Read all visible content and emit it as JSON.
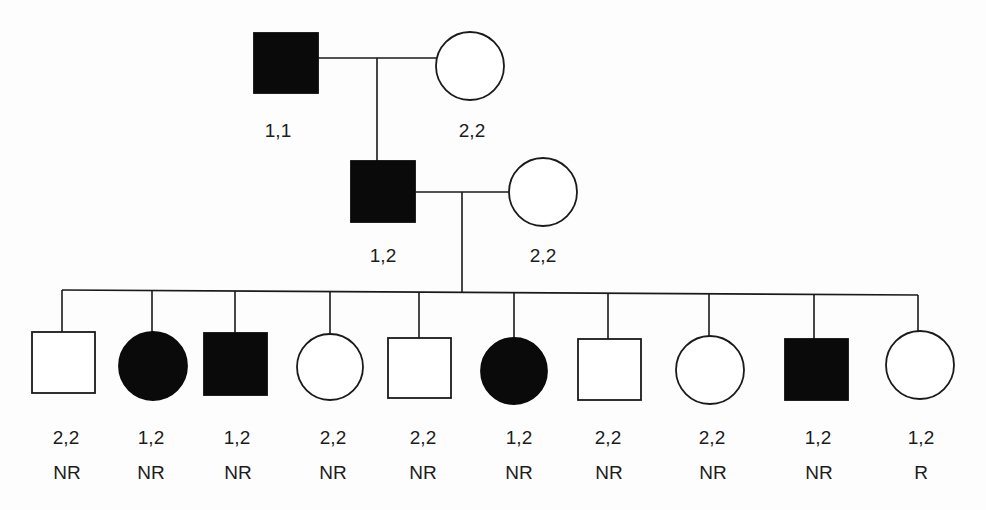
{
  "diagram": {
    "type": "pedigree",
    "legend_semantics": {
      "square": "male",
      "circle": "female",
      "filled": "affected",
      "open": "unaffected"
    },
    "colors": {
      "ink": "#0a0a0a",
      "background": "#fdfdfd"
    },
    "generation_1": {
      "father": {
        "sex": "male",
        "affected": true,
        "genotype": "1,1"
      },
      "mother": {
        "sex": "female",
        "affected": false,
        "genotype": "2,2"
      }
    },
    "generation_2": {
      "father": {
        "sex": "male",
        "affected": true,
        "genotype": "1,2"
      },
      "mother": {
        "sex": "female",
        "affected": false,
        "genotype": "2,2"
      }
    },
    "generation_3": [
      {
        "sex": "male",
        "affected": false,
        "genotype": "2,2",
        "status": "NR"
      },
      {
        "sex": "female",
        "affected": true,
        "genotype": "1,2",
        "status": "NR"
      },
      {
        "sex": "male",
        "affected": true,
        "genotype": "1,2",
        "status": "NR"
      },
      {
        "sex": "female",
        "affected": false,
        "genotype": "2,2",
        "status": "NR"
      },
      {
        "sex": "male",
        "affected": false,
        "genotype": "2,2",
        "status": "NR"
      },
      {
        "sex": "female",
        "affected": true,
        "genotype": "1,2",
        "status": "NR"
      },
      {
        "sex": "male",
        "affected": false,
        "genotype": "2,2",
        "status": "NR"
      },
      {
        "sex": "female",
        "affected": false,
        "genotype": "2,2",
        "status": "NR"
      },
      {
        "sex": "male",
        "affected": true,
        "genotype": "1,2",
        "status": "NR"
      },
      {
        "sex": "female",
        "affected": false,
        "genotype": "1,2",
        "status": "R"
      }
    ]
  }
}
